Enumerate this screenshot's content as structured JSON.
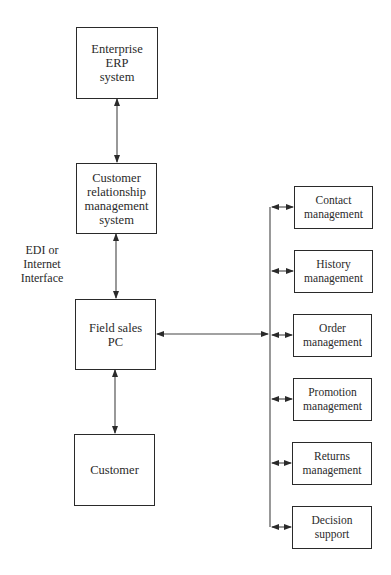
{
  "diagram": {
    "left_column": [
      {
        "id": "erp",
        "label": "Enterprise\nERP\nsystem"
      },
      {
        "id": "crm",
        "label": "Customer\nrelationship\nmanagement\nsystem"
      },
      {
        "id": "pc",
        "label": "Field sales\nPC"
      },
      {
        "id": "customer",
        "label": "Customer"
      }
    ],
    "side_label": "EDI or\nInternet\nInterface",
    "right_column": [
      {
        "id": "contact",
        "label": "Contact\nmanagement"
      },
      {
        "id": "history",
        "label": "History\nmanagement"
      },
      {
        "id": "order",
        "label": "Order\nmanagement"
      },
      {
        "id": "promotion",
        "label": "Promotion\nmanagement"
      },
      {
        "id": "returns",
        "label": "Returns\nmanagement"
      },
      {
        "id": "decision",
        "label": "Decision\nsupport"
      }
    ],
    "connections": [
      {
        "from": "erp",
        "to": "crm",
        "type": "bidirectional"
      },
      {
        "from": "crm",
        "to": "pc",
        "type": "bidirectional"
      },
      {
        "from": "pc",
        "to": "customer",
        "type": "bidirectional"
      },
      {
        "from": "pc",
        "to": "right-bus",
        "type": "bidirectional"
      },
      {
        "from": "right-bus",
        "to": "contact",
        "type": "bidirectional"
      },
      {
        "from": "right-bus",
        "to": "history",
        "type": "bidirectional"
      },
      {
        "from": "right-bus",
        "to": "order",
        "type": "bidirectional"
      },
      {
        "from": "right-bus",
        "to": "promotion",
        "type": "bidirectional"
      },
      {
        "from": "right-bus",
        "to": "returns",
        "type": "bidirectional"
      },
      {
        "from": "right-bus",
        "to": "decision",
        "type": "bidirectional"
      }
    ]
  }
}
